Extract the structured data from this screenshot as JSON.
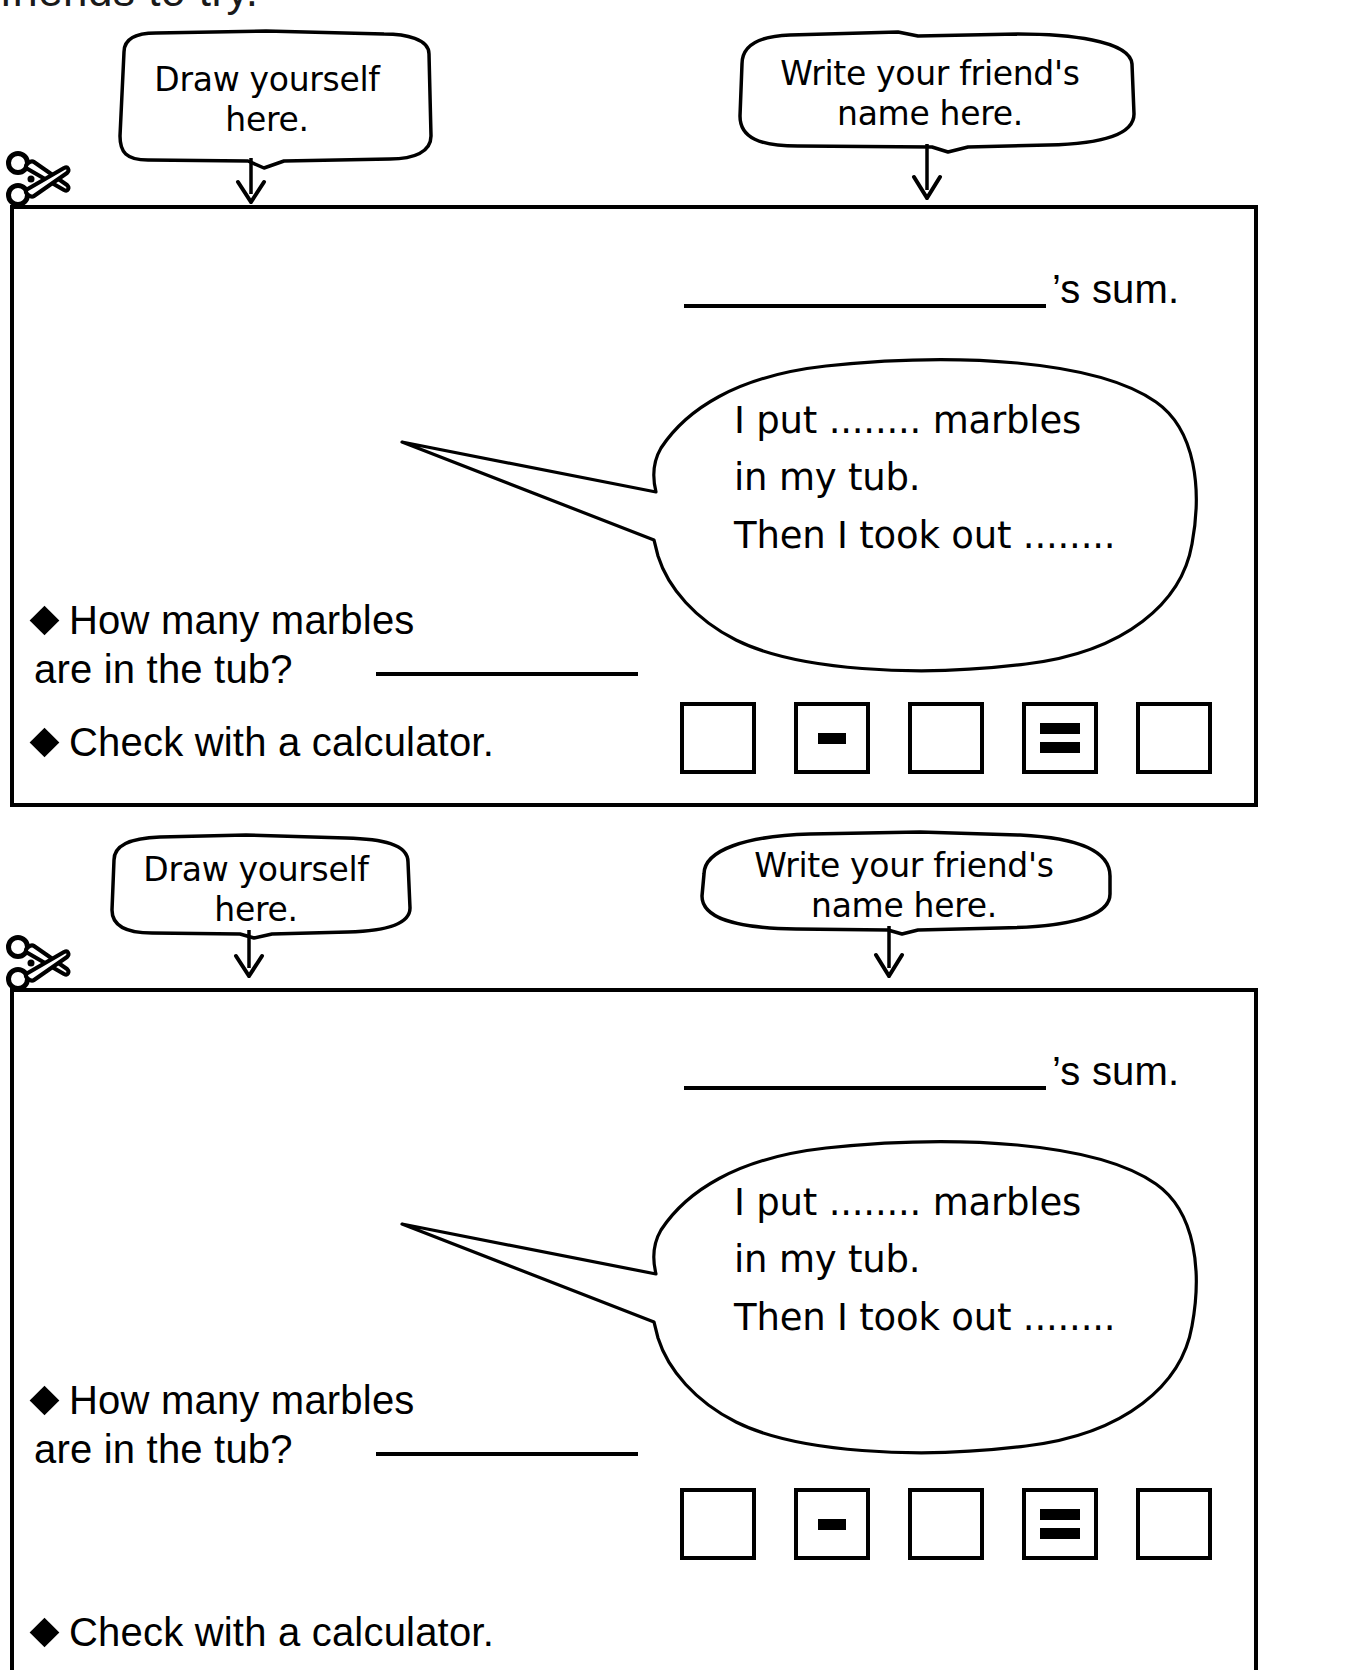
{
  "page": {
    "header_sliver_text": "friends to try.",
    "cut_icon": "scissors-icon"
  },
  "cards": [
    {
      "draw_callout": {
        "line1": "Draw yourself",
        "line2": "here.",
        "arrow": "down-arrow-icon"
      },
      "name_callout": {
        "line1": "Write your friend's",
        "line2": "name here.",
        "arrow": "down-arrow-icon"
      },
      "sum_label": "’s sum.",
      "balloon": {
        "line1": "I put ........ marbles",
        "line2": "in my tub.",
        "line3": "Then I took out ........"
      },
      "question": {
        "bullet": "diamond-bullet-icon",
        "line1": "How many marbles",
        "line2": "are in the tub?"
      },
      "check": {
        "bullet": "diamond-bullet-icon",
        "text": "Check with a calculator."
      },
      "calculator_keys": [
        {
          "name": "calc-key-blank-1",
          "symbol": ""
        },
        {
          "name": "calc-key-minus",
          "symbol": "−"
        },
        {
          "name": "calc-key-blank-2",
          "symbol": ""
        },
        {
          "name": "calc-key-equals",
          "symbol": "="
        },
        {
          "name": "calc-key-blank-3",
          "symbol": ""
        }
      ]
    },
    {
      "draw_callout": {
        "line1": "Draw yourself",
        "line2": "here.",
        "arrow": "down-arrow-icon"
      },
      "name_callout": {
        "line1": "Write your friend's",
        "line2": "name here.",
        "arrow": "down-arrow-icon"
      },
      "sum_label": "’s sum.",
      "balloon": {
        "line1": "I put ........ marbles",
        "line2": "in my tub.",
        "line3": "Then I took out ........"
      },
      "question": {
        "bullet": "diamond-bullet-icon",
        "line1": "How many marbles",
        "line2": "are in the tub?"
      },
      "check": {
        "bullet": "diamond-bullet-icon",
        "text": "Check with a calculator."
      },
      "calculator_keys": [
        {
          "name": "calc-key-blank-1",
          "symbol": ""
        },
        {
          "name": "calc-key-minus",
          "symbol": "−"
        },
        {
          "name": "calc-key-blank-2",
          "symbol": ""
        },
        {
          "name": "calc-key-equals",
          "symbol": "="
        },
        {
          "name": "calc-key-blank-3",
          "symbol": ""
        }
      ]
    }
  ],
  "colors": {
    "ink": "#000000",
    "paper": "#ffffff"
  }
}
